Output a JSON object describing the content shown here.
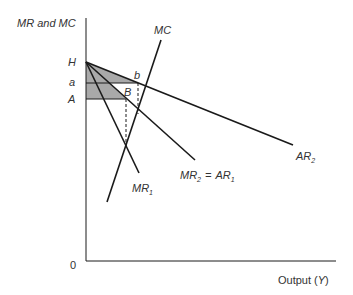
{
  "diagram": {
    "y_axis_label": "MR and MC",
    "x_axis_label_prefix": "Output (",
    "x_axis_label_var": "Y",
    "x_axis_label_suffix": ")",
    "origin_label": "0",
    "price_levels": [
      {
        "label": "H"
      },
      {
        "label": "a"
      },
      {
        "label": "A"
      }
    ],
    "points": [
      {
        "label": "b"
      },
      {
        "label": "B"
      }
    ],
    "curves": {
      "mc": {
        "label": "MC"
      },
      "mr1": {
        "label_main": "MR",
        "label_sub": "1"
      },
      "mr2_ar1": {
        "label_main1": "MR",
        "label_sub1": "2",
        "equals": "=",
        "label_main2": "AR",
        "label_sub2": "1"
      },
      "ar2": {
        "label_main": "AR",
        "label_sub": "2"
      }
    },
    "colors": {
      "line": "#1a1a1a",
      "shade": "#a9a9a9",
      "text": "#333333"
    }
  }
}
